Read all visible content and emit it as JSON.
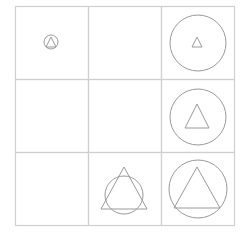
{
  "puzzle": {
    "rows": 3,
    "cols": 3,
    "grid": {
      "x": 15,
      "y": 6,
      "cell": 73,
      "line_color": "#cfcfcf"
    },
    "shape_color": "#9a9a9a",
    "cells": [
      {
        "row": 0,
        "col": 0,
        "circle": {
          "cx": 51,
          "cy": 42,
          "r": 7
        },
        "triangle": {
          "cx": 51,
          "top": 37,
          "base": 47,
          "half": 5
        }
      },
      {
        "row": 0,
        "col": 1
      },
      {
        "row": 0,
        "col": 2,
        "circle": {
          "cx": 198,
          "cy": 43,
          "r": 28
        },
        "triangle": {
          "cx": 197,
          "top": 37,
          "base": 47,
          "half": 5
        }
      },
      {
        "row": 1,
        "col": 0
      },
      {
        "row": 1,
        "col": 1
      },
      {
        "row": 1,
        "col": 2,
        "circle": {
          "cx": 198,
          "cy": 117,
          "r": 28
        },
        "triangle": {
          "cx": 197,
          "top": 104,
          "base": 128,
          "half": 12
        }
      },
      {
        "row": 2,
        "col": 0
      },
      {
        "row": 2,
        "col": 1,
        "circle": {
          "cx": 124,
          "cy": 195,
          "r": 19
        },
        "triangle": {
          "cx": 124,
          "top": 167,
          "base": 209,
          "half": 23
        }
      },
      {
        "row": 2,
        "col": 2,
        "circle": {
          "cx": 198,
          "cy": 189,
          "r": 29
        },
        "triangle": {
          "cx": 197,
          "top": 167,
          "base": 208,
          "half": 23
        }
      }
    ]
  }
}
